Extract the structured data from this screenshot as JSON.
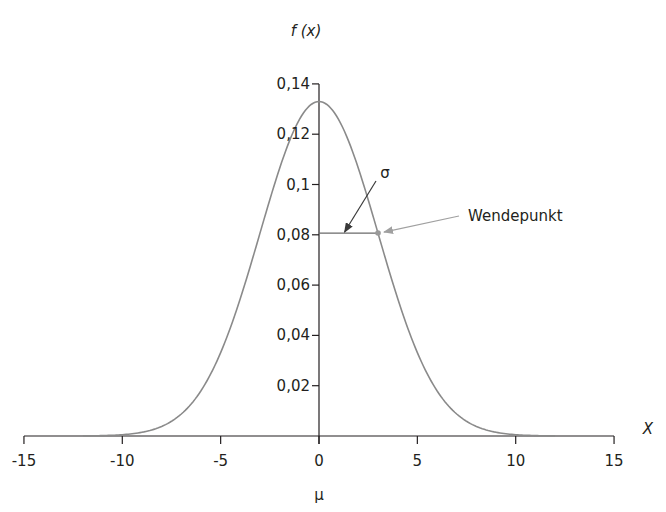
{
  "chart_data": {
    "type": "line",
    "title": "",
    "xlabel": "X",
    "ylabel": "f (x)",
    "x_sublabel": "μ",
    "xlim": [
      -15,
      15
    ],
    "ylim": [
      0,
      0.14
    ],
    "grid": false,
    "legend": null,
    "x_ticks": [
      -15,
      -10,
      -5,
      0,
      5,
      10,
      15
    ],
    "x_tick_labels": [
      "-15",
      "-10",
      "-5",
      "0",
      "5",
      "10",
      "15"
    ],
    "y_ticks": [
      0.02,
      0.04,
      0.06,
      0.08,
      0.1,
      0.12,
      0.14
    ],
    "y_tick_labels": [
      "0,02",
      "0,04",
      "0,06",
      "0,08",
      "0,1",
      "0,12",
      "0,14"
    ],
    "series": [
      {
        "name": "Normalverteilung",
        "distribution": "normal",
        "mu": 0,
        "sigma": 3,
        "color": "#8a8a8a",
        "x": [
          -15,
          -12,
          -10,
          -9,
          -8,
          -7,
          -6,
          -5,
          -4,
          -3,
          -2,
          -1,
          0,
          1,
          2,
          3,
          4,
          5,
          6,
          7,
          8,
          9,
          10,
          12,
          15
        ],
        "values": [
          0.0,
          0.0,
          0.0005,
          0.0015,
          0.0038,
          0.0087,
          0.018,
          0.0332,
          0.0547,
          0.0807,
          0.1065,
          0.1258,
          0.133,
          0.1258,
          0.1065,
          0.0807,
          0.0547,
          0.0332,
          0.018,
          0.0087,
          0.0038,
          0.0015,
          0.0005,
          0.0,
          0.0
        ]
      }
    ],
    "annotations": [
      {
        "text": "σ",
        "type": "arrow-label",
        "points_to": [
          1.3,
          0.0807
        ]
      },
      {
        "text": "Wendepunkt",
        "type": "arrow-label",
        "points_to": [
          3,
          0.0807
        ]
      }
    ],
    "sigma_segment": {
      "x0": 0,
      "x1": 3,
      "y": 0.0807
    }
  }
}
